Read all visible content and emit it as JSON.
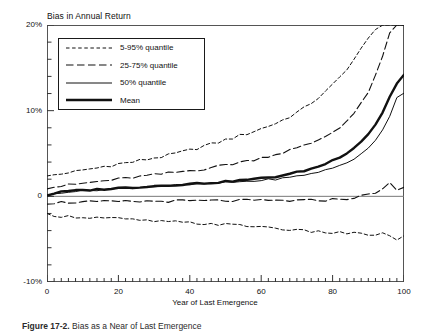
{
  "figure": {
    "caption_prefix": "Figure 17-2.",
    "caption_text": "Bias as a Near of Last Emergence"
  },
  "chart_data": {
    "type": "line",
    "title": "Bias in Annual Return",
    "xlabel": "Year of Last Emergence",
    "ylabel": "",
    "xlim": [
      0,
      100
    ],
    "ylim": [
      -10,
      20
    ],
    "grid": false,
    "legend_position": "top-left",
    "ytick_labels": [
      "20%",
      "10%",
      "0",
      "-10%"
    ],
    "ytick_values": [
      20,
      10,
      0,
      -10
    ],
    "xtick_labels": [
      "0",
      "20",
      "40",
      "60",
      "80",
      "100"
    ],
    "xtick_values": [
      0,
      20,
      40,
      60,
      80,
      100
    ],
    "y_minor_step": 2,
    "x_minor_step": 2,
    "x": [
      0,
      2,
      4,
      6,
      8,
      10,
      12,
      14,
      16,
      18,
      20,
      22,
      24,
      26,
      28,
      30,
      32,
      34,
      36,
      38,
      40,
      42,
      44,
      46,
      48,
      50,
      52,
      54,
      56,
      58,
      60,
      62,
      64,
      66,
      68,
      70,
      72,
      74,
      76,
      78,
      80,
      82,
      84,
      86,
      88,
      90,
      92,
      94,
      96,
      98,
      100
    ],
    "series": [
      {
        "name": "95% quantile",
        "legend": "5-95% quantile",
        "style": "dotted-dash",
        "values": [
          2.3,
          2.5,
          2.6,
          2.8,
          2.9,
          3.0,
          3.2,
          3.3,
          3.5,
          3.6,
          3.8,
          3.9,
          4.0,
          4.2,
          4.3,
          4.5,
          4.6,
          4.8,
          5.0,
          5.2,
          5.4,
          5.6,
          5.9,
          6.1,
          6.3,
          6.6,
          6.8,
          7.1,
          7.3,
          7.6,
          7.9,
          8.2,
          8.5,
          8.9,
          9.3,
          9.8,
          10.3,
          10.9,
          11.5,
          12.2,
          13.0,
          13.9,
          14.9,
          16.0,
          17.2,
          18.4,
          19.6,
          20.0,
          20.0,
          20.0,
          20.0
        ]
      },
      {
        "name": "75% quantile",
        "legend": "25-75% quantile",
        "style": "dashed",
        "values": [
          1.0,
          1.1,
          1.2,
          1.3,
          1.4,
          1.5,
          1.6,
          1.7,
          1.8,
          1.9,
          2.0,
          2.1,
          2.2,
          2.3,
          2.4,
          2.5,
          2.6,
          2.7,
          2.8,
          2.9,
          3.0,
          3.1,
          3.2,
          3.4,
          3.5,
          3.7,
          3.8,
          4.0,
          4.1,
          4.3,
          4.5,
          4.7,
          4.9,
          5.1,
          5.4,
          5.6,
          5.9,
          6.2,
          6.6,
          7.0,
          7.5,
          8.1,
          8.8,
          9.7,
          10.8,
          12.2,
          14.0,
          16.3,
          19.0,
          20.0,
          20.0
        ]
      },
      {
        "name": "Mean",
        "legend": "Mean",
        "style": "solid-thick",
        "values": [
          0.1,
          0.35,
          0.5,
          0.6,
          0.65,
          0.7,
          0.75,
          0.8,
          0.85,
          0.9,
          0.95,
          1.0,
          1.05,
          1.1,
          1.15,
          1.2,
          1.25,
          1.3,
          1.35,
          1.4,
          1.45,
          1.5,
          1.55,
          1.6,
          1.65,
          1.7,
          1.8,
          1.85,
          1.95,
          2.0,
          2.1,
          2.2,
          2.3,
          2.45,
          2.6,
          2.8,
          3.0,
          3.2,
          3.5,
          3.8,
          4.2,
          4.6,
          5.1,
          5.7,
          6.4,
          7.3,
          8.4,
          9.8,
          11.6,
          13.2,
          14.2
        ]
      },
      {
        "name": "50% quantile",
        "legend": "50% quantile",
        "style": "solid-thin",
        "values": [
          0.05,
          0.3,
          0.45,
          0.55,
          0.6,
          0.65,
          0.7,
          0.75,
          0.8,
          0.85,
          0.9,
          0.95,
          1.0,
          1.05,
          1.1,
          1.15,
          1.2,
          1.25,
          1.3,
          1.32,
          1.35,
          1.4,
          1.45,
          1.5,
          1.55,
          1.6,
          1.65,
          1.7,
          1.75,
          1.8,
          1.85,
          1.95,
          2.0,
          2.1,
          2.2,
          2.35,
          2.5,
          2.65,
          2.85,
          3.05,
          3.3,
          3.6,
          3.95,
          4.4,
          4.9,
          5.6,
          6.5,
          7.8,
          9.4,
          11.6,
          12.0
        ]
      },
      {
        "name": "25% quantile",
        "legend": "25-75% quantile",
        "style": "dashed",
        "values": [
          -0.8,
          -0.75,
          -0.7,
          -0.7,
          -0.68,
          -0.68,
          -0.66,
          -0.66,
          -0.64,
          -0.64,
          -0.62,
          -0.62,
          -0.6,
          -0.6,
          -0.58,
          -0.58,
          -0.56,
          -0.56,
          -0.55,
          -0.55,
          -0.54,
          -0.54,
          -0.53,
          -0.52,
          -0.52,
          -0.51,
          -0.5,
          -0.5,
          -0.5,
          -0.5,
          -0.5,
          -0.5,
          -0.5,
          -0.5,
          -0.5,
          -0.5,
          -0.5,
          -0.48,
          -0.45,
          -0.42,
          -0.38,
          -0.32,
          -0.25,
          -0.15,
          0.0,
          0.2,
          0.5,
          0.9,
          1.5,
          0.6,
          1.1
        ]
      },
      {
        "name": "5% quantile",
        "legend": "5-95% quantile",
        "style": "dotted-dash",
        "values": [
          -2.1,
          -2.2,
          -2.3,
          -2.35,
          -2.4,
          -2.42,
          -2.45,
          -2.48,
          -2.5,
          -2.55,
          -2.6,
          -2.7,
          -2.75,
          -2.8,
          -2.85,
          -2.9,
          -2.95,
          -3.0,
          -3.0,
          -3.05,
          -3.1,
          -3.15,
          -3.2,
          -3.2,
          -3.25,
          -3.3,
          -3.35,
          -3.4,
          -3.45,
          -3.5,
          -3.55,
          -3.6,
          -3.7,
          -3.8,
          -3.9,
          -4.0,
          -4.05,
          -4.1,
          -4.15,
          -4.2,
          -4.25,
          -4.2,
          -4.3,
          -4.35,
          -4.4,
          -4.45,
          -4.5,
          -4.4,
          -4.6,
          -5.0,
          -4.7
        ]
      }
    ]
  }
}
